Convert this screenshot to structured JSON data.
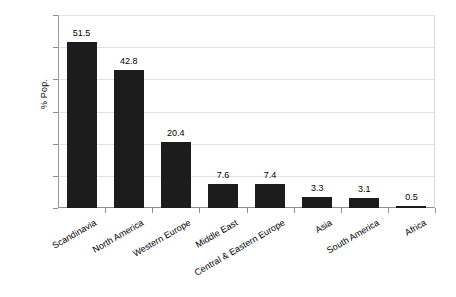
{
  "chart_data": {
    "type": "bar",
    "title": "",
    "subtitle": "",
    "xlabel": "",
    "ylabel": "% Pop.",
    "ylim": [
      0,
      60
    ],
    "ytick_step": 10,
    "ytick_labels": [
      "0.0",
      "10.0",
      "20.0",
      "30.0",
      "40.0",
      "50.0",
      "60.0"
    ],
    "grid": true,
    "legend": "none",
    "categories": [
      "Scandinavia",
      "North America",
      "Western Europe",
      "Middle East",
      "Central & Eastern Europe",
      "Asia",
      "South America",
      "Africa"
    ],
    "values": [
      51.5,
      42.8,
      20.4,
      7.6,
      7.4,
      3.3,
      3.1,
      0.5
    ],
    "value_labels": [
      "51.5",
      "42.8",
      "20.4",
      "7.6",
      "7.4",
      "3.3",
      "3.1",
      "0.5"
    ],
    "bar_color": "#1c1c1c",
    "grid_color": "#e2e2e2",
    "axis_color": "#8f8f8f",
    "background": "#ffffff"
  }
}
